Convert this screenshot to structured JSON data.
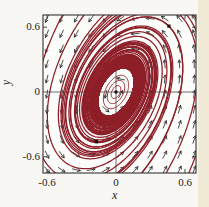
{
  "figure": {
    "x_axis_label": "x",
    "y_axis_label": "y",
    "x_tick_labels": [
      "-0.6",
      "0",
      "0.6"
    ],
    "y_tick_labels": [
      "0.6",
      "0",
      "-0.6"
    ]
  },
  "chart_data": {
    "type": "line",
    "subtype": "phase-portrait-with-vector-field",
    "title": "",
    "xlabel": "x",
    "ylabel": "y",
    "xlim": [
      -0.635,
      0.696
    ],
    "ylim": [
      -0.75,
      0.713
    ],
    "x_ticks": [
      -0.6,
      0,
      0.6
    ],
    "y_ticks": [
      -0.6,
      0,
      0.6
    ],
    "grid": false,
    "legend": "none",
    "rotation": "counterclockwise",
    "colors": {
      "trajectory": "#8e1f28",
      "arrows": "#1f1f1f",
      "frame": "#333333",
      "axes": "#555555",
      "plot_bg": "#fcfcfa",
      "page_bg": "#f8f7f3",
      "page_strip": "#efe9d5",
      "marker": "#111111",
      "label": "#1b1b1b"
    },
    "system": {
      "description": "v = A*p + s(r)*p ; Q = 1.7x^2 - 1.0xy + 0.85y^2 ; r = sqrt(Q) ; s = -k_out*(r-R0) if r>R0 else k_in*(R0-r)",
      "A": [
        [
          0.5,
          -0.85
        ],
        [
          1.7,
          -0.5
        ]
      ],
      "Q": {
        "xx": 1.7,
        "xy": -1.0,
        "yy": 0.85
      },
      "R0": 0.185,
      "k_out": 0.35,
      "k_in": 0.9
    },
    "field_grid": {
      "x_start": -0.6,
      "x_step": 0.128,
      "nx": 11,
      "y_start": -0.72,
      "y_step": 0.14,
      "ny": 11,
      "arrow_len_px": 8,
      "head_len_px": 3.1,
      "head_angle_rad": 0.5
    },
    "trajectories": {
      "dt": 0.03,
      "T_forward": 65,
      "T_backward": 7,
      "seeds_forward": [
        [
          -0.66,
          0.74
        ],
        [
          -0.45,
          0.74
        ],
        [
          -0.26,
          0.74
        ],
        [
          -0.08,
          0.74
        ],
        [
          0.1,
          0.74
        ],
        [
          0.2,
          0.72
        ],
        [
          0.02,
          -0.78
        ],
        [
          0.2,
          -0.78
        ],
        [
          0.42,
          -0.78
        ],
        [
          0.62,
          -0.78
        ],
        [
          0.73,
          -0.3
        ],
        [
          0.73,
          -0.05
        ]
      ],
      "seeds_bidirectional": [
        [
          0.46,
          0.61
        ],
        [
          -0.17,
          -0.46
        ]
      ]
    },
    "inner_orbit_radii": [
      0.05,
      0.09,
      0.13
    ],
    "inner_orbit_period": 5.8,
    "marked_points": [
      [
        0,
        0
      ],
      [
        0.46,
        0.61
      ],
      [
        -0.17,
        -0.46
      ]
    ],
    "layout": {
      "px": {
        "x0": 116,
        "sx": 115,
        "y0": 92,
        "sy": 108,
        "frame": [
          43,
          15,
          196,
          173
        ],
        "tick_len": 4,
        "width": 209,
        "height": 207
      }
    }
  }
}
